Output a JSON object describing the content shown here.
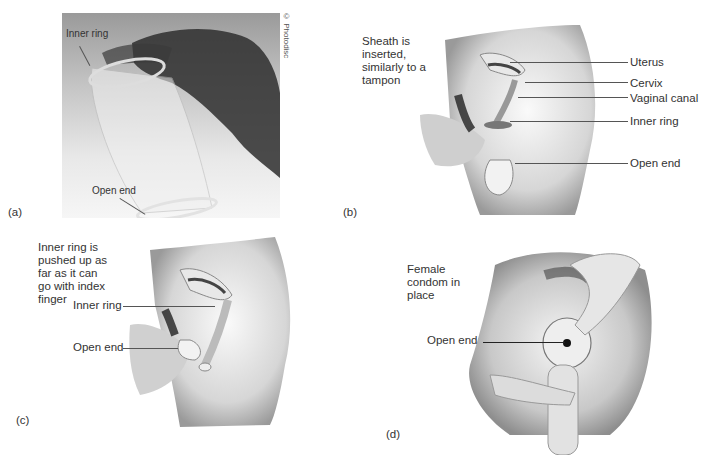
{
  "figure": {
    "panels": [
      {
        "id": "a",
        "panel_label": "(a)",
        "credit": "© Photodisc",
        "labels": [
          "Inner ring",
          "Open end"
        ]
      },
      {
        "id": "b",
        "panel_label": "(b)",
        "caption": "Sheath is inserted, similarly to a tampon",
        "caption_lines": [
          "Sheath is",
          "inserted,",
          "similarly to a",
          "tampon"
        ],
        "labels": [
          "Uterus",
          "Cervix",
          "Vaginal canal",
          "Inner ring",
          "Open end"
        ]
      },
      {
        "id": "c",
        "panel_label": "(c)",
        "caption": "Inner ring is pushed up as far as it can go with index finger",
        "caption_lines": [
          "Inner ring is",
          "pushed up as",
          "far as it can",
          "go with index",
          "finger"
        ],
        "labels": [
          "Inner ring",
          "Open end"
        ]
      },
      {
        "id": "d",
        "panel_label": "(d)",
        "caption": "Female condom in place",
        "caption_lines": [
          "Female",
          "condom in",
          "place"
        ],
        "labels": [
          "Open end"
        ]
      }
    ]
  }
}
